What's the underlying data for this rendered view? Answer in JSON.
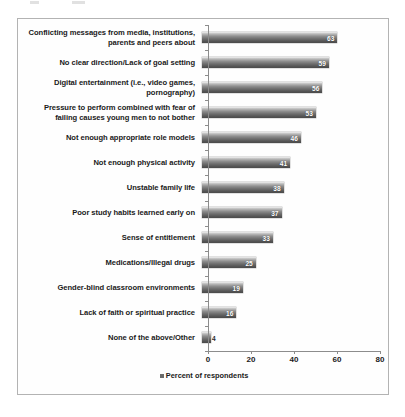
{
  "chart_data": {
    "type": "bar",
    "orientation": "horizontal",
    "title": "",
    "xlabel": "",
    "ylabel": "",
    "xlim": [
      0,
      80
    ],
    "xticks": [
      0,
      20,
      40,
      60,
      80
    ],
    "grid": false,
    "legend_position": "bottom-center",
    "legend": [
      "Percent of respondents"
    ],
    "categories": [
      "Conflicting messages from media, institutions, parents and peers about",
      "No clear direction/Lack of goal setting",
      "Digital entertainment (i.e., video games, pornography)",
      "Pressure to perform combined with fear of failing causes young men to not bother",
      "Not enough appropriate role models",
      "Not enough physical activity",
      "Unstable family life",
      "Poor study habits learned early on",
      "Sense of entitlement",
      "Medications/Illegal drugs",
      "Gender-blind classroom environments",
      "Lack of faith or spiritual practice",
      "None of the above/Other"
    ],
    "values": [
      63,
      59,
      56,
      53,
      46,
      41,
      38,
      37,
      33,
      25,
      19,
      16,
      4
    ],
    "value_label_inside": [
      true,
      true,
      true,
      true,
      true,
      true,
      true,
      true,
      true,
      true,
      true,
      true,
      false
    ],
    "series_name": "Percent of respondents",
    "bar_color": "#6e6e6e",
    "axis_color": "#8c8c8c",
    "frame_color": "#b3b3b3",
    "value_label_color": "#ffffff"
  },
  "legend": {
    "swatch_color": "#6b6b6b",
    "label": "Percent of respondents"
  }
}
